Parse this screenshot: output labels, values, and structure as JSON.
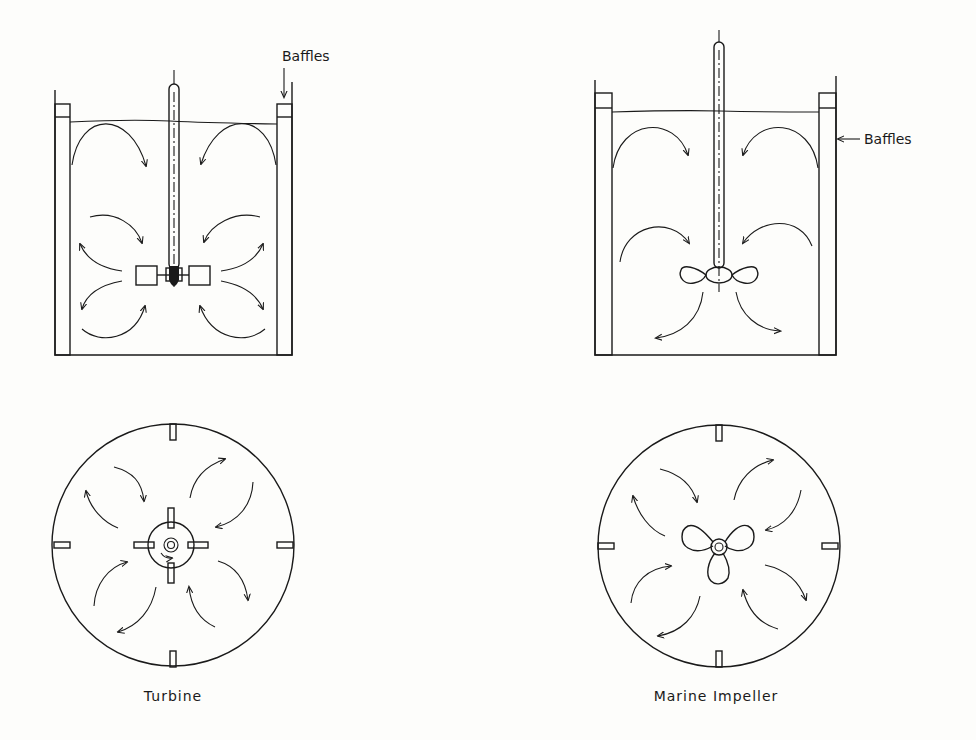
{
  "diagram": {
    "panels": [
      {
        "id": "turbine",
        "caption": "Turbine",
        "side_view": {
          "annotation": "Baffles",
          "annotation_position": "top, arrow pointing down to right baffle"
        },
        "top_view": {
          "baffle_count": 4
        }
      },
      {
        "id": "marine",
        "caption": "Marine Impeller",
        "side_view": {
          "annotation": "Baffles",
          "annotation_position": "right, arrow pointing left to right tank wall"
        },
        "top_view": {
          "baffle_count": 4
        }
      }
    ],
    "colors": {
      "ink": "#1a1a1a",
      "paper": "#fdfdfb"
    }
  }
}
